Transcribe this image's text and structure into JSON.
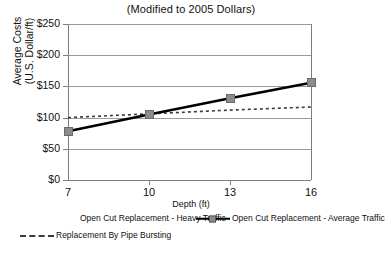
{
  "chart_data": {
    "type": "line",
    "title": "(Modified to 2005 Dollars)",
    "xlabel": "Depth (ft)",
    "ylabel": "Average Costs",
    "ylabel_line2": "(U.S. Dollar/ft)",
    "x": [
      7,
      10,
      13,
      16
    ],
    "xtick_labels": [
      "7",
      "10",
      "13",
      "16"
    ],
    "ytick_labels": [
      "$0",
      "$50",
      "$100",
      "$150",
      "$200",
      "$250"
    ],
    "ytick_values": [
      0,
      50,
      100,
      150,
      200,
      250
    ],
    "ylim": [
      0,
      250
    ],
    "xlim": [
      7,
      16
    ],
    "grid": "horizontal",
    "legend_position": "bottom",
    "series": [
      {
        "name": "Open Cut Replacement - Heavy Traffic",
        "style": "none",
        "values": [
          null,
          null,
          null,
          null
        ]
      },
      {
        "name": "Open Cut Replacement - Average Traffic",
        "style": "solid-with-square-markers",
        "color": "#000000",
        "marker_color": "#8c8c8c",
        "values": [
          78,
          105,
          131,
          156
        ]
      },
      {
        "name": "Replacement By Pipe Bursting",
        "style": "dotted",
        "color": "#3a3a3a",
        "values": [
          100,
          106,
          112,
          117
        ]
      }
    ]
  },
  "axes": {
    "y_title_line1": "Average Costs",
    "y_title_line2": "(U.S. Dollar/ft)",
    "x_title": "Depth (ft)"
  },
  "title": {
    "text": "(Modified to 2005 Dollars)"
  },
  "yticks": [
    {
      "label": "$250",
      "value": 250
    },
    {
      "label": "$200",
      "value": 200
    },
    {
      "label": "$150",
      "value": 150
    },
    {
      "label": "$100",
      "value": 100
    },
    {
      "label": "$50",
      "value": 50
    },
    {
      "label": "$0",
      "value": 0
    }
  ],
  "xticks": [
    {
      "label": "7",
      "value": 7
    },
    {
      "label": "10",
      "value": 10
    },
    {
      "label": "13",
      "value": 13
    },
    {
      "label": "16",
      "value": 16
    }
  ],
  "legend": {
    "items": [
      {
        "label": "Open Cut Replacement - Heavy Traffic",
        "style": "blank"
      },
      {
        "label": "Open Cut Replacement - Average Traffic",
        "style": "solid"
      },
      {
        "label": "Replacement By Pipe Bursting",
        "style": "dotted"
      }
    ]
  }
}
